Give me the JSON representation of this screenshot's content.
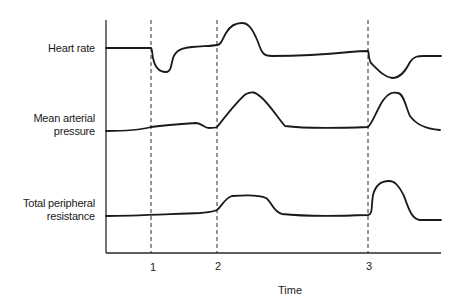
{
  "chart_data": {
    "type": "line",
    "title": "",
    "xlabel": "Time",
    "ylabel": "",
    "x_ticks": [
      {
        "label": "1",
        "x": 151
      },
      {
        "label": "2",
        "x": 217
      },
      {
        "label": "3",
        "x": 368
      }
    ],
    "event_markers": [
      "1",
      "2",
      "3"
    ],
    "grid": false,
    "legend": null,
    "series": [
      {
        "name": "Heart rate",
        "label_lines": [
          "Heart rate"
        ],
        "description": "Flat baseline until event 1, sharp drop then recovery to slightly above baseline; rises to peak after event 2 then falls below baseline and stays flat; at event 3 drops to a trough then recovers to near new baseline",
        "path": "M106,48 L151,48 C152,48 152,52 153,58 C155,68 160,72 166,72 C171,72 171,66 173,58 C176,50 182,48 192,47 C205,46 212,46 217,45 C221,45 222,40 226,33 C231,24 237,23 242,23 C249,23 253,30 258,42 C262,54 264,56 272,56 C300,56 330,54 350,52 C360,51 365,51 368,51 C369,51 368,58 371,63 C378,70 384,77 392,78 C400,78 405,72 410,62 C414,56 418,56 424,56 L441,56"
      },
      {
        "name": "Mean arterial pressure",
        "label_lines": [
          "Mean arterial",
          "pressure"
        ],
        "description": "Slight gradual rise until just before event 2, small dip, then rise to peak and fall back to baseline; at event 3 rises to a peak then falls to slightly below",
        "path": "M106,131 C125,131 140,130 151,127 C165,125 180,124 196,123 C202,123 204,128 209,128 C214,128 215,128 217,127 C225,117 238,100 246,94 C252,91 255,92 261,97 C270,105 278,118 285,126 C300,128 340,128 368,127 C372,124 376,112 382,102 C388,93 392,92 398,93 C404,94 406,108 410,116 C416,124 424,129 440,130"
      },
      {
        "name": "Total peripheral resistance",
        "label_lines": [
          "Total peripheral",
          "resistance"
        ],
        "description": "Flat baseline until event 2, rises to plateau, returns to baseline; at event 3 rises sharply to a higher peak then returns to baseline",
        "path": "M106,216 C130,216 170,214 200,213 C210,212 213,212 217,210 C222,206 225,198 232,196 C245,195 260,195 266,198 C272,202 273,212 282,214 C300,216 340,216 368,215 C373,214 371,208 373,195 C376,183 383,181 389,181 C395,181 399,186 404,196 C409,210 412,219 420,220 L441,220"
      }
    ]
  },
  "labels": {
    "heart_rate": "Heart rate",
    "map_line1": "Mean arterial",
    "map_line2": "pressure",
    "tpr_line1": "Total peripheral",
    "tpr_line2": "resistance",
    "tick1": "1",
    "tick2": "2",
    "tick3": "3",
    "x_title": "Time"
  },
  "colors": {
    "line": "#1a1a1a",
    "axis": "#2a2a2a",
    "dash": "#2a2a2a",
    "background": "#ffffff"
  }
}
